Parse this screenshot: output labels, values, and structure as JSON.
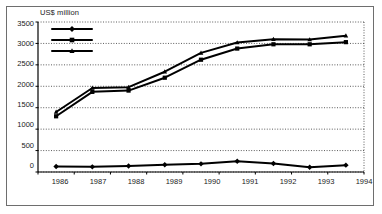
{
  "chart_data": {
    "type": "line",
    "title": "",
    "ylabel": "US$ million",
    "xlabel": "",
    "categories": [
      "1986",
      "1987",
      "1988",
      "1989",
      "1990",
      "1991",
      "1992",
      "1993",
      "1994"
    ],
    "ylim": [
      0,
      3500
    ],
    "yticks": [
      0,
      500,
      1000,
      1500,
      2000,
      2500,
      3000,
      3500
    ],
    "grid": true,
    "legend_position": "top-left",
    "series": [
      {
        "name": "Short term*",
        "marker": "diamond",
        "color": "#000000",
        "values": [
          130,
          120,
          140,
          170,
          190,
          250,
          200,
          110,
          160
        ]
      },
      {
        "name": "Medium and long term",
        "marker": "square",
        "color": "#000000",
        "values": [
          1300,
          1870,
          1900,
          2200,
          2620,
          2880,
          2980,
          2980,
          3030
        ]
      },
      {
        "name": "Total *",
        "marker": "triangle",
        "color": "#000000",
        "values": [
          1400,
          1960,
          1980,
          2340,
          2780,
          3020,
          3100,
          3090,
          3180
        ]
      }
    ]
  },
  "axis": {
    "ylabel": "US$ million",
    "yticks": [
      "3500",
      "3000",
      "2500",
      "2000",
      "1500",
      "1000",
      "500",
      "0"
    ],
    "xticks": [
      "1986",
      "1987",
      "1988",
      "1989",
      "1990",
      "1991",
      "1992",
      "1993",
      "1994"
    ]
  },
  "legend": {
    "items": [
      {
        "label": "Short term*",
        "marker": "diamond"
      },
      {
        "label": "Medium and long term",
        "marker": "square"
      },
      {
        "label": "Total *",
        "marker": "triangle"
      }
    ]
  }
}
